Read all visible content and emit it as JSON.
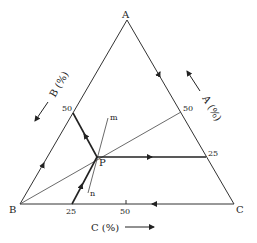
{
  "diagram": {
    "type": "ternary-phase-diagram",
    "vertices": {
      "A": "A",
      "B": "B",
      "C": "C"
    },
    "point_label": "P",
    "line_labels": {
      "m": "m",
      "n": "n"
    },
    "axis_labels": {
      "a": "A (%)",
      "b": "B (%)",
      "c": "C (%)"
    },
    "ticks": {
      "ab_50": "50",
      "ac_50": "50",
      "ac_25": "25",
      "bc_25": "25",
      "bc_50": "50"
    }
  }
}
